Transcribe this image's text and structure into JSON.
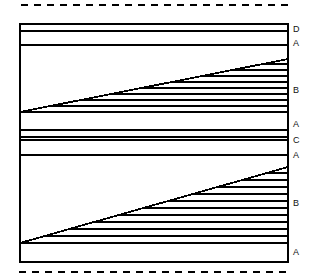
{
  "figure": {
    "background_color": "#ffffff",
    "line_color": "#000000",
    "canvas": {
      "width": 311,
      "height": 280
    }
  },
  "dashed_rules": [
    {
      "name": "top-dashed-rule",
      "y": 5,
      "x_start": 21,
      "x_end": 291,
      "dash": "7 6",
      "stroke_width": 2.6
    },
    {
      "name": "bottom-dashed-rule",
      "y": 272,
      "x_start": 19,
      "x_end": 291,
      "dash": "7 6",
      "stroke_width": 2.6
    }
  ],
  "frame": {
    "name": "outer-frame",
    "left": 20,
    "right": 288,
    "top": 24,
    "bottom": 262,
    "stroke_width": 1.6
  },
  "upper_block": {
    "name": "upper-block",
    "top": 24,
    "bottom": 130,
    "thin_band_lines": [
      31,
      45
    ],
    "diagonal": {
      "x1": 20,
      "y1": 112,
      "x2": 288,
      "y2": 59
    },
    "hatch_lines": [
      59,
      64,
      70,
      76,
      82,
      88,
      94,
      100,
      106,
      112
    ],
    "baseline": 112
  },
  "middle_band": {
    "name": "middle-band",
    "lines": [
      130,
      137,
      140,
      155
    ]
  },
  "lower_block": {
    "name": "lower-block",
    "top": 155,
    "bottom": 262,
    "diagonal": {
      "x1": 20,
      "y1": 243,
      "x2": 288,
      "y2": 167
    },
    "hatch_lines": [
      167,
      173,
      180,
      187,
      194,
      201,
      208,
      215,
      222,
      229,
      236,
      243
    ],
    "baseline": 243
  },
  "edge_labels": [
    {
      "name": "edge-label-d-top",
      "text": "D",
      "x": 293,
      "y": 25
    },
    {
      "name": "edge-label-a-upper",
      "text": "A",
      "x": 293,
      "y": 39
    },
    {
      "name": "edge-label-b-upper",
      "text": "B",
      "x": 293,
      "y": 86
    },
    {
      "name": "edge-label-a-mid-1",
      "text": "A",
      "x": 293,
      "y": 120
    },
    {
      "name": "edge-label-c-mid",
      "text": "C",
      "x": 293,
      "y": 136
    },
    {
      "name": "edge-label-a-mid-2",
      "text": "A",
      "x": 293,
      "y": 151
    },
    {
      "name": "edge-label-b-lower",
      "text": "B",
      "x": 293,
      "y": 199
    },
    {
      "name": "edge-label-a-bottom",
      "text": "A",
      "x": 293,
      "y": 248
    }
  ]
}
